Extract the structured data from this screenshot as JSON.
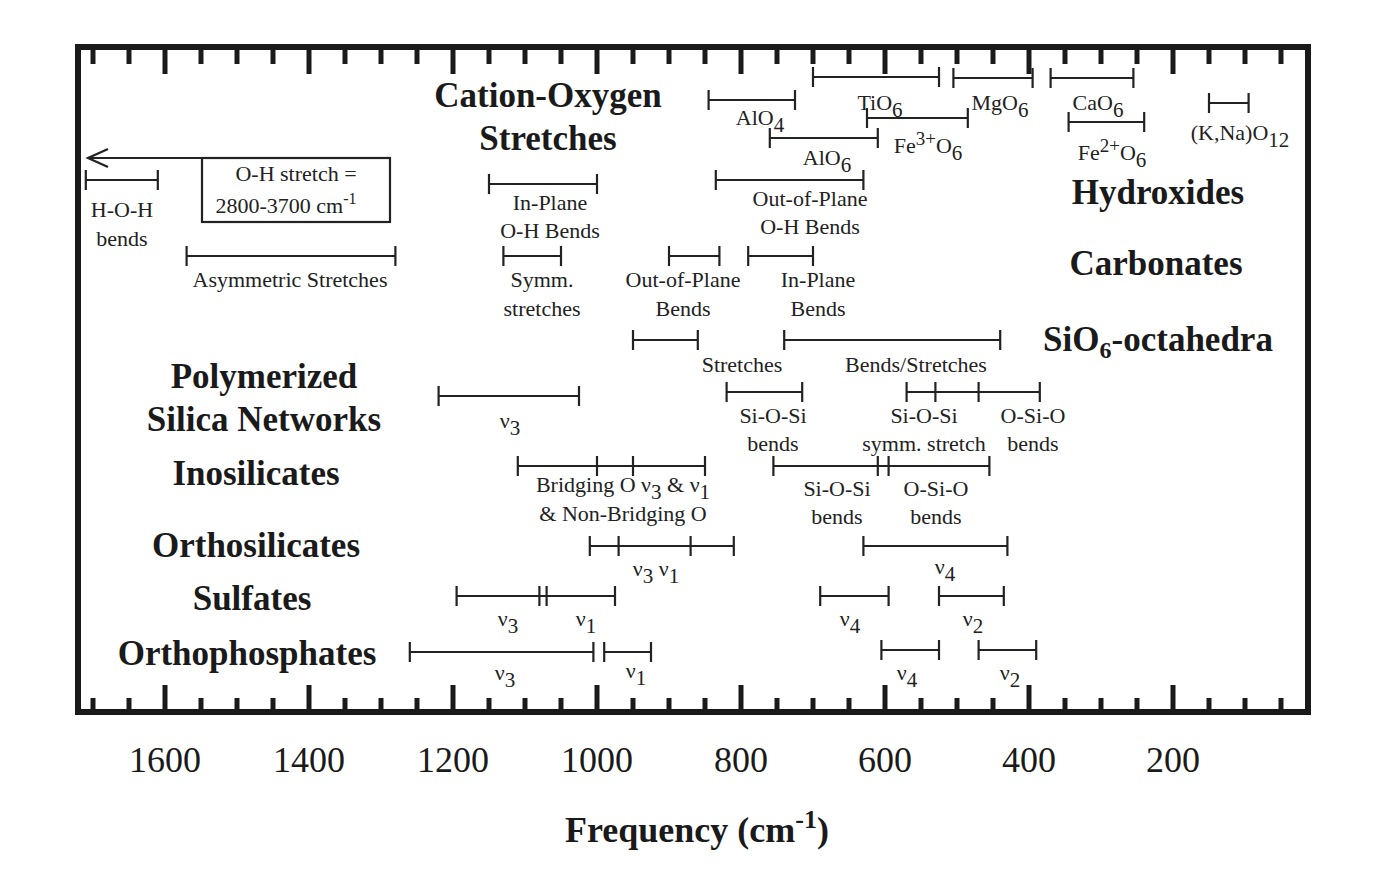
{
  "chart_data": {
    "type": "range-diagram",
    "title": "",
    "xlabel": "Frequency (cm-1)",
    "xlabel_main": "Frequency (cm",
    "xlabel_sup": "-1",
    "xlabel_close": ")",
    "x_axis": {
      "reversed": true,
      "ticks": [
        1600,
        1400,
        1200,
        1000,
        800,
        600,
        400,
        200
      ],
      "minor_step": 50,
      "xlim": [
        1730,
        20
      ]
    },
    "groups": [
      {
        "name": "Cation-Oxygen Stretches",
        "lines": [
          "Cation-Oxygen",
          "Stretches"
        ],
        "x": 548,
        "y": [
          107,
          150
        ]
      },
      {
        "name": "Hydroxides",
        "lines": [
          "Hydroxides"
        ],
        "x": 1158,
        "y": [
          204
        ]
      },
      {
        "name": "Carbonates",
        "lines": [
          "Carbonates"
        ],
        "x": 1156,
        "y": [
          275
        ]
      },
      {
        "name": "SiO6-octahedra",
        "lines": [
          "SiO6-octahedra"
        ],
        "x": 1158,
        "y": [
          351
        ]
      },
      {
        "name": "Polymerized Silica Networks",
        "lines": [
          "Polymerized",
          "Silica Networks"
        ],
        "x": 264,
        "y": [
          388,
          431
        ]
      },
      {
        "name": "Inosilicates",
        "lines": [
          "Inosilicates"
        ],
        "x": 256,
        "y": [
          485
        ]
      },
      {
        "name": "Orthosilicates",
        "lines": [
          "Orthosilicates"
        ],
        "x": 256,
        "y": [
          557
        ]
      },
      {
        "name": "Sulfates",
        "lines": [
          "Sulfates"
        ],
        "x": 252,
        "y": [
          610
        ]
      },
      {
        "name": "Orthophosphates",
        "lines": [
          "Orthophosphates"
        ],
        "x": 247,
        "y": [
          665
        ]
      }
    ],
    "ranges": [
      {
        "group": "Cation-Oxygen",
        "label": "TiO6",
        "from": 700,
        "to": 525,
        "y": 77,
        "ticks": [],
        "label_lines": [
          "TiO6"
        ],
        "lx": 880,
        "ly": [
          110
        ]
      },
      {
        "group": "Cation-Oxygen",
        "label": "AlO4",
        "from": 845,
        "to": 725,
        "y": 100,
        "ticks": [],
        "label_lines": [
          "AlO4"
        ],
        "lx": 760,
        "ly": [
          125
        ]
      },
      {
        "group": "Cation-Oxygen",
        "label": "MgO6",
        "from": 505,
        "to": 395,
        "y": 78,
        "ticks": [],
        "label_lines": [
          "MgO6"
        ],
        "lx": 1000,
        "ly": [
          110
        ]
      },
      {
        "group": "Cation-Oxygen",
        "label": "CaO6",
        "from": 370,
        "to": 255,
        "y": 78,
        "ticks": [],
        "label_lines": [
          "CaO6"
        ],
        "lx": 1098,
        "ly": [
          110
        ]
      },
      {
        "group": "Cation-Oxygen",
        "label": "Fe3+O6",
        "from": 625,
        "to": 485,
        "y": 118,
        "ticks": [],
        "label_lines": [
          "Fe3+O6"
        ],
        "lx": 928,
        "ly": [
          153
        ]
      },
      {
        "group": "Cation-Oxygen",
        "label": "AlO6",
        "from": 760,
        "to": 610,
        "y": 138,
        "ticks": [],
        "label_lines": [
          "AlO6"
        ],
        "lx": 827,
        "ly": [
          165
        ]
      },
      {
        "group": "Cation-Oxygen",
        "label": "Fe2+O6",
        "from": 345,
        "to": 240,
        "y": 122,
        "ticks": [],
        "label_lines": [
          "Fe2+O6"
        ],
        "lx": 1112,
        "ly": [
          160
        ]
      },
      {
        "group": "Cation-Oxygen",
        "label": "(K,Na)O12",
        "from": 150,
        "to": 95,
        "y": 103,
        "ticks": [],
        "label_lines": [
          "(K,Na)O12"
        ],
        "lx": 1240,
        "ly": [
          140
        ]
      },
      {
        "group": "Hydroxides",
        "label": "H-O-H bends",
        "from": 1710,
        "to": 1610,
        "y": 180,
        "ticks": [],
        "label_lines": [
          "H-O-H",
          "bends"
        ],
        "lx": 122,
        "ly": [
          217,
          246
        ]
      },
      {
        "group": "Hydroxides",
        "label": "In-Plane O-H Bends",
        "from": 1150,
        "to": 1000,
        "y": 184,
        "ticks": [],
        "label_lines": [
          "In-Plane",
          "O-H Bends"
        ],
        "lx": 550,
        "ly": [
          210,
          238
        ]
      },
      {
        "group": "Hydroxides",
        "label": "Out-of-Plane O-H Bends",
        "from": 835,
        "to": 630,
        "y": 180,
        "ticks": [],
        "label_lines": [
          "Out-of-Plane",
          "O-H Bends"
        ],
        "lx": 810,
        "ly": [
          206,
          234
        ]
      },
      {
        "group": "Carbonates",
        "label": "Asymmetric Stretches",
        "from": 1570,
        "to": 1280,
        "y": 256,
        "ticks": [],
        "label_lines": [
          "Asymmetric Stretches"
        ],
        "lx": 290,
        "ly": [
          287
        ]
      },
      {
        "group": "Carbonates",
        "label": "Symm. stretches",
        "from": 1130,
        "to": 1050,
        "y": 256,
        "ticks": [],
        "label_lines": [
          "Symm.",
          "stretches"
        ],
        "lx": 542,
        "ly": [
          287,
          316
        ]
      },
      {
        "group": "Carbonates",
        "label": "Out-of-Plane Bends",
        "from": 900,
        "to": 830,
        "y": 256,
        "ticks": [],
        "label_lines": [
          "Out-of-Plane",
          "Bends"
        ],
        "lx": 683,
        "ly": [
          287,
          316
        ]
      },
      {
        "group": "Carbonates",
        "label": "In-Plane Bends",
        "from": 790,
        "to": 700,
        "y": 256,
        "ticks": [],
        "label_lines": [
          "In-Plane",
          "Bends"
        ],
        "lx": 818,
        "ly": [
          287,
          316
        ]
      },
      {
        "group": "SiO6-octahedra",
        "label": "Stretches",
        "from": 950,
        "to": 860,
        "y": 340,
        "ticks": [],
        "label_lines": [
          "Stretches"
        ],
        "lx": 742,
        "ly": [
          372
        ]
      },
      {
        "group": "SiO6-octahedra",
        "label": "Bends/Stretches",
        "from": 740,
        "to": 440,
        "y": 340,
        "ticks": [],
        "label_lines": [
          "Bends/Stretches"
        ],
        "lx": 916,
        "ly": [
          372
        ]
      },
      {
        "group": "Polymerized Silica Networks",
        "label": "v3",
        "from": 1220,
        "to": 1025,
        "y": 396,
        "ticks": [],
        "label_lines": [
          "ν3"
        ],
        "lx": 510,
        "ly": [
          428
        ]
      },
      {
        "group": "Polymerized Silica Networks",
        "label": "Si-O-Si bends",
        "from": 820,
        "to": 715,
        "y": 392,
        "ticks": [],
        "label_lines": [
          "Si-O-Si",
          "bends"
        ],
        "lx": 773,
        "ly": [
          423,
          451
        ]
      },
      {
        "group": "Polymerized Silica Networks",
        "label": "Si-O-Si symm. stretch / O-Si-O bends",
        "from": 570,
        "to": 385,
        "y": 392,
        "ticks": [
          530,
          470
        ],
        "label_lines": [
          "Si-O-Si",
          "symm. stretch"
        ],
        "lx": 924,
        "ly": [
          423,
          451
        ]
      },
      {
        "group": "Polymerized Silica Networks",
        "label": "O-Si-O bends",
        "from": null,
        "to": null,
        "y": 0,
        "ticks": [],
        "label_lines": [
          "O-Si-O",
          "bends"
        ],
        "lx": 1033,
        "ly": [
          423,
          451
        ]
      },
      {
        "group": "Inosilicates",
        "label": "Bridging O & Non-Bridging O v3 & v1",
        "from": 1110,
        "to": 850,
        "y": 466,
        "ticks": [
          1000,
          950
        ],
        "label_lines": [
          "Bridging O ν3 & ν1",
          "& Non-Bridging O"
        ],
        "lx": 623,
        "ly": [
          492,
          521
        ]
      },
      {
        "group": "Inosilicates",
        "label": "Si-O-Si bends / O-Si-O bends",
        "from": 755,
        "to": 455,
        "y": 466,
        "ticks": [
          610,
          595
        ],
        "label_lines": [
          "Si-O-Si",
          "bends"
        ],
        "lx": 837,
        "ly": [
          496,
          524
        ]
      },
      {
        "group": "Inosilicates",
        "label": "O-Si-O bends",
        "from": null,
        "to": null,
        "y": 0,
        "ticks": [],
        "label_lines": [
          "O-Si-O",
          "bends"
        ],
        "lx": 936,
        "ly": [
          496,
          524
        ]
      },
      {
        "group": "Orthosilicates",
        "label": "v3 v1",
        "from": 1010,
        "to": 810,
        "y": 546,
        "ticks": [
          970,
          870
        ],
        "label_lines": [
          "ν3  ν1"
        ],
        "lx": 656,
        "ly": [
          576
        ]
      },
      {
        "group": "Orthosilicates",
        "label": "v4",
        "from": 630,
        "to": 430,
        "y": 546,
        "ticks": [],
        "label_lines": [
          "ν4"
        ],
        "lx": 945,
        "ly": [
          574
        ]
      },
      {
        "group": "Sulfates",
        "label": "v3 v1",
        "from": 1195,
        "to": 975,
        "y": 596,
        "ticks": [
          1080,
          1070
        ],
        "label_lines": [
          "ν3",
          "ν1"
        ],
        "lx": 508,
        "ly": [
          626
        ],
        "lx2": 586
      },
      {
        "group": "Sulfates",
        "label": "v4",
        "from": 690,
        "to": 595,
        "y": 596,
        "ticks": [],
        "label_lines": [
          "ν4"
        ],
        "lx": 850,
        "ly": [
          626
        ]
      },
      {
        "group": "Sulfates",
        "label": "v2",
        "from": 525,
        "to": 435,
        "y": 596,
        "ticks": [],
        "label_lines": [
          "ν2"
        ],
        "lx": 973,
        "ly": [
          626
        ]
      },
      {
        "group": "Orthophosphates",
        "label": "v3",
        "from": 1260,
        "to": 1005,
        "y": 652,
        "ticks": [],
        "label_lines": [
          "ν3"
        ],
        "lx": 505,
        "ly": [
          680
        ]
      },
      {
        "group": "Orthophosphates",
        "label": "v1",
        "from": 990,
        "to": 925,
        "y": 652,
        "ticks": [],
        "label_lines": [
          "ν1"
        ],
        "lx": 636,
        "ly": [
          678
        ]
      },
      {
        "group": "Orthophosphates",
        "label": "v4",
        "from": 605,
        "to": 525,
        "y": 650,
        "ticks": [],
        "label_lines": [
          "ν4"
        ],
        "lx": 907,
        "ly": [
          680
        ]
      },
      {
        "group": "Orthophosphates",
        "label": "v2",
        "from": 470,
        "to": 390,
        "y": 650,
        "ticks": [],
        "label_lines": [
          "ν2"
        ],
        "lx": 1010,
        "ly": [
          680
        ]
      }
    ],
    "annotations": [
      {
        "text": "O-H stretch = 2800-3700 cm-1",
        "lines": [
          "O-H stretch =",
          "2800-3700 cm"
        ],
        "sup": "-1",
        "arrow": "left"
      }
    ]
  }
}
